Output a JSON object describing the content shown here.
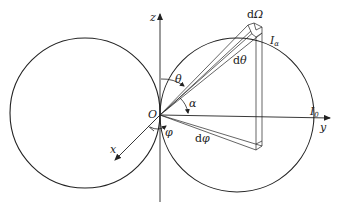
{
  "diagram": {
    "type": "radiation-pattern",
    "axes": {
      "z": "z",
      "y": "y",
      "x": "x"
    },
    "origin_label": "O",
    "angles": {
      "theta": "θ",
      "alpha": "α",
      "phi": "φ"
    },
    "elements": {
      "solid_angle": "Ω",
      "solid_angle_prefix": "d",
      "d_theta_prefix": "d",
      "d_theta": "θ",
      "d_phi_prefix": "d",
      "d_phi": "φ"
    },
    "intensities": {
      "I_alpha_main": "I",
      "I_alpha_sub": "α",
      "I_0_main": "I",
      "I_0_sub": "0"
    },
    "colors": {
      "stroke": "#222222",
      "background": "#ffffff"
    }
  }
}
